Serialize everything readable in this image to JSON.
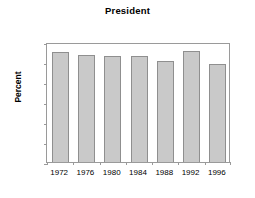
{
  "chart_data": {
    "type": "bar",
    "title": "President",
    "xlabel": "",
    "ylabel": "Percent",
    "categories": [
      "1972",
      "1976",
      "1980",
      "1984",
      "1988",
      "1992",
      "1996"
    ],
    "values": [
      55.2,
      53.4,
      52.8,
      53.2,
      50.4,
      55.3,
      49.0
    ],
    "ylim": [
      0,
      60
    ],
    "ytick_values": [
      0,
      10,
      20,
      30,
      40,
      50,
      60
    ],
    "ytick_labels": [
      "0",
      "10",
      "20",
      "30",
      "40",
      "50",
      "60"
    ],
    "grid": false,
    "legend": null,
    "bar_color": "#c9c9c9",
    "bar_edge_color": "#8f8f8f",
    "axis_color": "#9a9a9a",
    "background_color": "#ffffff"
  }
}
